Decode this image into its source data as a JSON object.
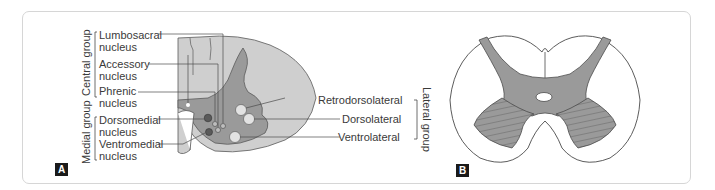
{
  "panel_a": {
    "tag": "A",
    "groups": {
      "central": "Central group",
      "medial": "Medial group",
      "lateral": "Lateral group"
    },
    "labels": {
      "lumbosacral_1": "Lumbosacral",
      "lumbosacral_2": "nucleus",
      "accessory_1": "Accessory",
      "accessory_2": "nucleus",
      "phrenic_1": "Phrenic",
      "phrenic_2": "nucleus",
      "dorsomedial_1": "Dorsomedial",
      "dorsomedial_2": "nucleus",
      "ventromedial_1": "Ventromedial",
      "ventromedial_2": "nucleus",
      "retrodorsolateral": "Retrodorsolateral",
      "dorsolateral": "Dorsolateral",
      "ventrolateral": "Ventrolateral"
    }
  },
  "panel_b": {
    "tag": "B"
  },
  "colors": {
    "grey_matter": "#9a9a9a",
    "white_matter": "#cfcfcf",
    "outline": "#4a4a4a"
  }
}
